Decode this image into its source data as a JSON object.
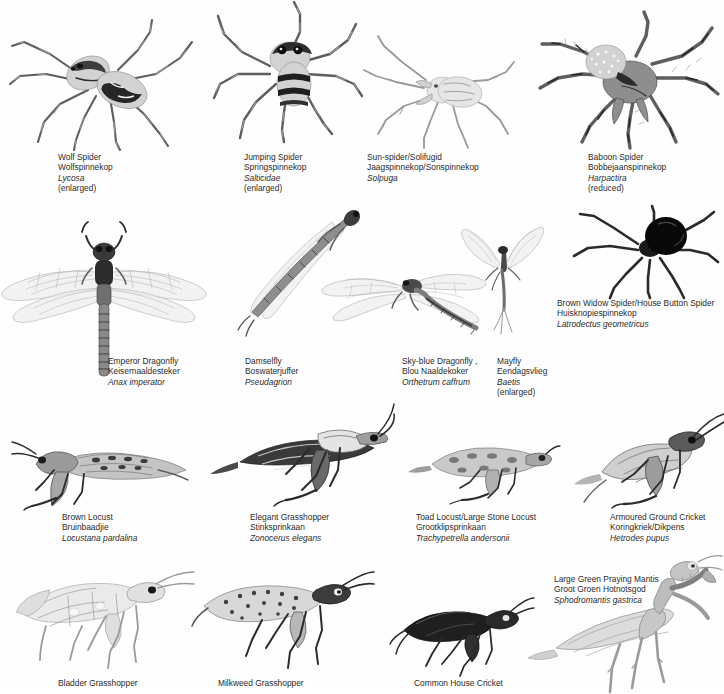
{
  "plate": {
    "title": "Spiders and Insects Identification Plate",
    "background_color": "#ffffff",
    "text_color": "#2b2b2b",
    "caption_format": [
      "english_name",
      "afrikaans_name",
      "scientific_name",
      "scale_note"
    ]
  },
  "rows": [
    {
      "row": 1,
      "group": "spiders-and-solifuges",
      "specimens": [
        {
          "id": "wolf-spider",
          "en": "Wolf Spider",
          "af": "Wolfspinnekop",
          "sci": "Lycosa",
          "note": "(enlarged)",
          "caption_x": 58,
          "caption_y": 152,
          "art_x": 10,
          "art_y": 18,
          "art_w": 190,
          "art_h": 130
        },
        {
          "id": "jumping-spider",
          "en": "Jumping Spider",
          "af": "Springspinnekop",
          "sci": "Salticidae",
          "note": "(enlarged)",
          "caption_x": 244,
          "caption_y": 152,
          "art_x": 212,
          "art_y": 0,
          "art_w": 150,
          "art_h": 140
        },
        {
          "id": "sun-spider-solifugid",
          "en": "Sun-spider/Solifugid",
          "af": "Jaagspinnekop/Sonspinnekop",
          "sci": "Solpuga",
          "note": "",
          "caption_x": 367,
          "caption_y": 152,
          "art_x": 364,
          "art_y": 38,
          "art_w": 150,
          "art_h": 110
        },
        {
          "id": "baboon-spider",
          "en": "Baboon Spider",
          "af": "Bobbejaanspinnekop",
          "sci": "Harpactira",
          "note": "(reduced)",
          "caption_x": 588,
          "caption_y": 152,
          "art_x": 540,
          "art_y": 14,
          "art_w": 184,
          "art_h": 134
        }
      ]
    },
    {
      "row": 2,
      "group": "dragonflies-mayflies-widow",
      "specimens": [
        {
          "id": "emperor-dragonfly",
          "en": "Emperor Dragonfly",
          "af": "Keisernaaldesteker",
          "sci": "Anax imperator",
          "note": "",
          "caption_x": 108,
          "caption_y": 356,
          "art_x": 0,
          "art_y": 218,
          "art_w": 222,
          "art_h": 160
        },
        {
          "id": "damselfly",
          "en": "Damselfly",
          "af": "Boswaterjuffer",
          "sci": "Pseudagrion",
          "note": "",
          "caption_x": 245,
          "caption_y": 356,
          "art_x": 212,
          "art_y": 212,
          "art_w": 160,
          "art_h": 130
        },
        {
          "id": "sky-blue-dragonfly",
          "en": "Sky-blue Dragonfly ,",
          "af": "Blou Naaldekoker",
          "sci": "Orthetrum caffrum",
          "note": "",
          "caption_x": 402,
          "caption_y": 356,
          "art_x": 310,
          "art_y": 246,
          "art_w": 190,
          "art_h": 100
        },
        {
          "id": "mayfly",
          "en": "Mayfly",
          "af": "Eendagsvlieg",
          "sci": "Baetis",
          "note": "(enlarged)",
          "caption_x": 497,
          "caption_y": 356,
          "art_x": 446,
          "art_y": 224,
          "art_w": 120,
          "art_h": 110
        },
        {
          "id": "brown-widow-spider",
          "en": "Brown Widow Spider/House Button Spider",
          "af": "Huisknopiespinnekop",
          "sci": "Latrodectus geometricus",
          "note": "",
          "caption_x": 557,
          "caption_y": 298,
          "art_x": 570,
          "art_y": 210,
          "art_w": 154,
          "art_h": 84
        }
      ]
    },
    {
      "row": 3,
      "group": "locusts-grasshoppers-crickets",
      "specimens": [
        {
          "id": "brown-locust",
          "en": "Brown Locust",
          "af": "Bruinbaadjie",
          "sci": "Locustana pardalina",
          "note": "",
          "caption_x": 62,
          "caption_y": 512,
          "art_x": 8,
          "art_y": 424,
          "art_w": 190,
          "art_h": 84
        },
        {
          "id": "elegant-grasshopper",
          "en": "Elegant Grasshopper",
          "af": "Stinksprinkaan",
          "sci": "Zonocerus elegans",
          "note": "",
          "caption_x": 250,
          "caption_y": 512,
          "art_x": 200,
          "art_y": 392,
          "art_w": 190,
          "art_h": 116
        },
        {
          "id": "toad-locust",
          "en": "Toad Locust/Large Stone Locust",
          "af": "Grootklipsprinkaan",
          "sci": "Trachypetrella andersonii",
          "note": "",
          "caption_x": 416,
          "caption_y": 512,
          "art_x": 404,
          "art_y": 434,
          "art_w": 150,
          "art_h": 72
        },
        {
          "id": "armoured-ground-cricket",
          "en": "Armoured Ground Cricket",
          "af": "Koringkriek/Dikpens",
          "sci": "Hetrodes pupus",
          "note": "",
          "caption_x": 610,
          "caption_y": 512,
          "art_x": 570,
          "art_y": 414,
          "art_w": 154,
          "art_h": 94
        }
      ]
    },
    {
      "row": 4,
      "group": "grasshoppers-cricket-mantis",
      "specimens": [
        {
          "id": "bladder-grasshopper",
          "en": "Bladder Grasshopper",
          "af": "",
          "sci": "",
          "note": "",
          "caption_x": 58,
          "caption_y": 678,
          "art_x": 14,
          "art_y": 556,
          "art_w": 180,
          "art_h": 116
        },
        {
          "id": "milkweed-grasshopper",
          "en": "Milkweed Grasshopper",
          "af": "",
          "sci": "",
          "note": "",
          "caption_x": 218,
          "caption_y": 678,
          "art_x": 190,
          "art_y": 560,
          "art_w": 180,
          "art_h": 112
        },
        {
          "id": "common-house-cricket",
          "en": "Common House Cricket",
          "af": "",
          "sci": "",
          "note": "",
          "caption_x": 414,
          "caption_y": 678,
          "art_x": 390,
          "art_y": 598,
          "art_w": 140,
          "art_h": 76
        },
        {
          "id": "large-green-praying-mantis",
          "en": "Large Green Praying Mantis",
          "af": "Groot Groen Hotnotsgod",
          "sci": "Sphodromantis gastrica",
          "note": "",
          "caption_x": 554,
          "caption_y": 574,
          "art_x": 528,
          "art_y": 556,
          "art_w": 196,
          "art_h": 135
        }
      ]
    }
  ]
}
